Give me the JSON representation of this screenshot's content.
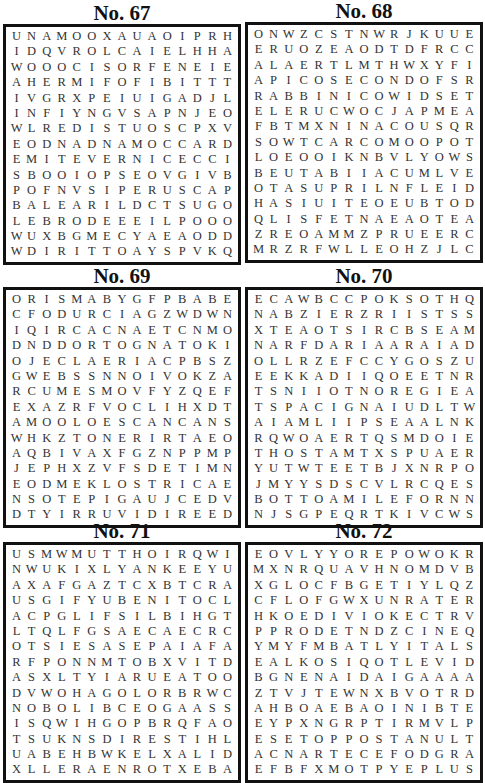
{
  "puzzles": [
    {
      "title": "No. 67",
      "rows": [
        "UNAMOOXAUAOIPRH",
        "IDQVROLCAIELHHA",
        "WOOOCISORFENEIE",
        "AHERMIFOFIBITTT",
        "IVGRXPEIUIGADJL",
        "INFIYNGVSAPNJEO",
        "WLREDISTUOSCPXV",
        "EODNADNAMOCCARD",
        "EMITEVERNICECCI",
        "SBOOIOPSEOVGIVB",
        "POFNVSIPERUSCAP",
        "BALEARILDCTSUGO",
        "LEBRODEEEILPOOO",
        "WUXBGMECYAEAODD",
        "WDIRITTOAYSPVKQ"
      ]
    },
    {
      "title": "No. 68",
      "rows": [
        "ONWZCSTNWRJKUUE",
        "ERUOZEAODTDFRCC",
        "ALAERTLMTHWXYFI",
        "APICOSECONDOFSR",
        "RABBINICOWIDSET",
        "ELERUCWOCJAPMEA",
        "FBTMXNINACOUSQR",
        "SOWTCARCOMOOPOT",
        "LOEOOIKNBVLYOWS",
        "BEUTABIIACUMLVE",
        "OTASUPRILNFLEID",
        "HASIUITEOEUBTOD",
        "QLISFETNAEAOTEA",
        "ZREOAMMZPRUEERC",
        "MRZRFWLLEOHZJLC"
      ]
    },
    {
      "title": "No. 69",
      "rows": [
        "ORISMABYGFPBABE",
        "CFODURCIAGZWDWN",
        "IQIRCACNAETCNMO",
        "DNDDORTOGNATOKI",
        "OJECLAERIACPBSZ",
        "GWEBSSNNOIVOKZA",
        "RCUMESMOVFYZQEF",
        "EXAZRFVOCLIHXDT",
        "AMOOLOESCANCANS",
        "WHKZTONERIRTAEO",
        "AQBIVAXFGZNPPMP",
        "JEPHXZVFSDETIMN",
        "EODMEKLOSTRICAE",
        "NSOTEPIGAUJCEDV",
        "DTYIRRUVIDIREED"
      ]
    },
    {
      "title": "No. 70",
      "rows": [
        "ECAWBCCPOKSOTHQ",
        "NABZIERZRIISTSS",
        "XTEAOTSIRCBSEAM",
        "NARFDARIAARAIAD",
        "OLLRZEFCCYGOSZU",
        "EEKKADIIQOEETNR",
        "TSNIIOTNOREGIEA",
        "TSPACIGNAIUDLTW",
        "AIAMLIIPSEAALNK",
        "RQWOAERTQSMDOIE",
        "THOSTAMTXSPUAER",
        "YUTWTEETBJXNRPO",
        "JMYYSDSCVLRCQES",
        "BOTTOAMILEFORNN",
        "NJSGPEQRTKIVCWS"
      ]
    },
    {
      "title": "No. 71",
      "rows": [
        "USMWMUTTHOIRQWI",
        "NWUKIXLYANKEEYU",
        "AXAFGAZTCXBTCRA",
        "USGIFYUBENITOCL",
        "ACPGLIFSILBIHGT",
        "LTQLFGSAECAECRC",
        "OTSIESASEPAIAFA",
        "RFPONNMTOBXVITD",
        "ASXLTYIARUEATOO",
        "DVWOHAGOLORBRWC",
        "NOBOLIBCEOGAASS",
        "ISQWIHGOPBRQFAO",
        "TSUKNSDIRESTIHL",
        "UABEHBWKELXALID",
        "XLLERAENROTXEBA"
      ]
    },
    {
      "title": "No. 72",
      "rows": [
        "EOVLYYOREPOWOKR",
        "MXNRQUAVHNOMDVB",
        "XGLOCFBGETIYLQZ",
        "CFLOFGWXUNRATER",
        "HKOEDIVIOKECTRV",
        "PPRODETNDZCINEQ",
        "YMYFMBATLYITALS",
        "EALKOSIQOTLEVID",
        "BGNENAIDAIGAAAA",
        "ZTVJTEWNXBVOTRD",
        "AHBOAEBAOINIBTE",
        "EYPXNGRPTIRMVLP",
        "ESETOPPOSTANULT",
        "ACNARTECEFODGRA",
        "EFBFXMOTPYEPLUS"
      ]
    }
  ]
}
